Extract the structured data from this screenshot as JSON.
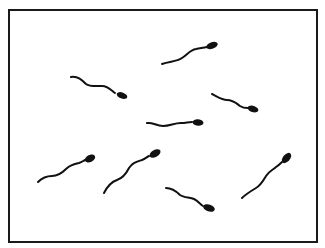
{
  "figure": {
    "frame_color": "#1a1a1a",
    "cell_color": "#111111",
    "cell_count": 8,
    "cells": [
      {
        "id": 1,
        "label": "sperm-cell-top-center",
        "head": [
          212,
          45
        ],
        "direction": "up-right"
      },
      {
        "id": 2,
        "label": "sperm-cell-upper-left",
        "head": [
          123,
          96
        ],
        "direction": "down-right"
      },
      {
        "id": 3,
        "label": "sperm-cell-upper-right",
        "head": [
          254,
          109
        ],
        "direction": "down-right"
      },
      {
        "id": 4,
        "label": "sperm-cell-center",
        "head": [
          198,
          123
        ],
        "direction": "right"
      },
      {
        "id": 5,
        "label": "sperm-cell-lower-left",
        "head": [
          90,
          159
        ],
        "direction": "up-right"
      },
      {
        "id": 6,
        "label": "sperm-cell-lower-center-left",
        "head": [
          156,
          154
        ],
        "direction": "up-right"
      },
      {
        "id": 7,
        "label": "sperm-cell-bottom-center",
        "head": [
          210,
          208
        ],
        "direction": "down-right"
      },
      {
        "id": 8,
        "label": "sperm-cell-lower-right",
        "head": [
          287,
          158
        ],
        "direction": "up-right"
      }
    ]
  }
}
